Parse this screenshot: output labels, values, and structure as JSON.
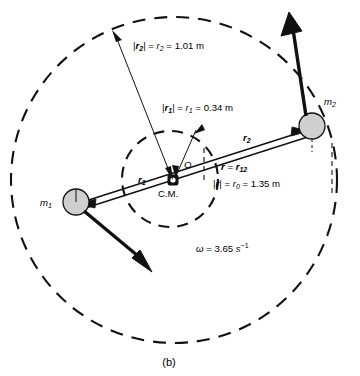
{
  "figure": {
    "caption": "(b)"
  },
  "labels": {
    "r2_magnitude": {
      "vec": "r",
      "vec_sub": "2",
      "scalar": "r",
      "scalar_sub": "2",
      "value": "1.01",
      "unit": "m",
      "full": "|r2| = r2 = 1.01 m"
    },
    "r1_magnitude": {
      "vec": "r",
      "vec_sub": "1",
      "scalar": "r",
      "scalar_sub": "1",
      "value": "0.34",
      "unit": "m",
      "full": "|r1| = r1 = 0.34 m"
    },
    "r_separation": {
      "vec": "r",
      "equals_vec": "r",
      "equals_vec_sub": "12",
      "full": "r = r12"
    },
    "r0_magnitude": {
      "vec": "r",
      "scalar": "r",
      "scalar_sub": "0",
      "value": "1.35",
      "unit": "m",
      "full": "|r| = r0 = 1.35 m"
    },
    "omega": {
      "symbol": "ω",
      "value": "3.65",
      "unit": "s",
      "exponent": "−1",
      "full": "ω = 3.65 s⁻¹"
    },
    "mass1": {
      "symbol": "m",
      "sub": "1"
    },
    "mass2": {
      "symbol": "m",
      "sub": "2"
    },
    "origin": "O",
    "center_of_mass": "C.M.",
    "vector_r1": {
      "symbol": "r",
      "sub": "1"
    },
    "vector_r2": {
      "symbol": "r",
      "sub": "2"
    }
  },
  "colors": {
    "stroke": "#111111",
    "mass_fill": "#cfcfcf",
    "background": "#ffffff"
  },
  "geometry": {
    "center_x": 174,
    "center_y": 180,
    "outer_radius": 163,
    "inner_radius": 47,
    "mass1_x": 76,
    "mass1_y": 202,
    "mass1_radius": 13,
    "mass2_x": 312,
    "mass2_y": 126,
    "mass2_radius": 13,
    "cm_x": 173,
    "cm_y": 180
  }
}
